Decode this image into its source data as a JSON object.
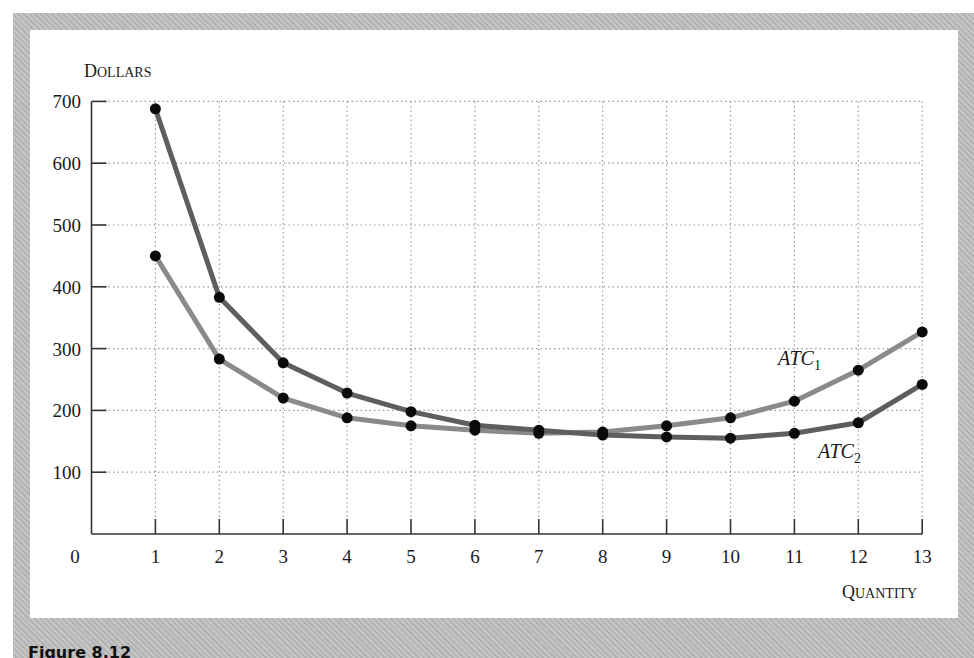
{
  "figure": {
    "caption": "Figure 8.12"
  },
  "chart_data": {
    "type": "line",
    "title": "",
    "xlabel": "Quantity",
    "ylabel": "Dollars",
    "x": [
      1,
      2,
      3,
      4,
      5,
      6,
      7,
      8,
      9,
      10,
      11,
      12,
      13
    ],
    "xticks": [
      "0",
      "1",
      "2",
      "3",
      "4",
      "5",
      "6",
      "7",
      "8",
      "9",
      "10",
      "11",
      "12",
      "13"
    ],
    "yticks": [
      "100",
      "200",
      "300",
      "400",
      "500",
      "600",
      "700"
    ],
    "xlim": [
      0,
      13
    ],
    "ylim": [
      0,
      700
    ],
    "grid": true,
    "legend_position": "inline labels near right end of curves",
    "series": [
      {
        "name": "ATC1",
        "label_main": "ATC",
        "label_sub": "1",
        "color": "#8a8a8a",
        "values": [
          450,
          283,
          220,
          188,
          175,
          168,
          163,
          165,
          175,
          188,
          215,
          265,
          327
        ]
      },
      {
        "name": "ATC2",
        "label_main": "ATC",
        "label_sub": "2",
        "color": "#5e5e5e",
        "values": [
          688,
          383,
          277,
          228,
          198,
          176,
          168,
          160,
          157,
          155,
          163,
          180,
          242
        ]
      }
    ],
    "axis_titles": {
      "y_first": "D",
      "y_rest": "OLLARS",
      "x_first": "Q",
      "x_rest": "UANTITY"
    },
    "origin_label": "0"
  }
}
